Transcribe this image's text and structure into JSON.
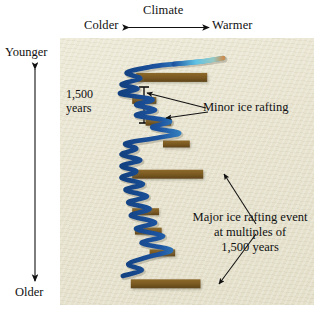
{
  "figure": {
    "background_color": "#ffffff",
    "panel_color": "#e9e5d2"
  },
  "climate_axis": {
    "title": "Climate",
    "left_label": "Colder",
    "right_label": "Warmer",
    "arrow": "double-headed-horizontal"
  },
  "time_axis": {
    "top_label": "Younger",
    "bottom_label": "Older",
    "arrow": "double-headed-vertical"
  },
  "scale_bar": {
    "line1": "1,500",
    "line2": "years",
    "glyph": "i-beam"
  },
  "annotations": {
    "minor": "Minor ice rafting",
    "major_line1": "Major ice rafting event",
    "major_line2": "at multiples of",
    "major_line3": "1,500 years"
  },
  "chart_data": {
    "type": "line",
    "title": "Climate",
    "xlabel": "Climate",
    "ylabel": "Time",
    "grid": false,
    "legend": null,
    "x_axis": {
      "direction": "left-to-right",
      "left_tick_label": "Colder",
      "right_tick_label": "Warmer"
    },
    "y_axis": {
      "direction": "top-to-bottom",
      "top_tick_label": "Younger",
      "bottom_tick_label": "Older",
      "scale_reference": "1,500 years"
    },
    "series": [
      {
        "name": "climate-proxy-curve",
        "description": "Oscillating climate proxy record, warm (right) to cold (left) excursions",
        "color_cold": "#1d54a0",
        "color_warm": "#5fc3e4",
        "color_tip": "#c98f52",
        "points": [
          [
            0.95,
            0.025
          ],
          [
            0.78,
            0.04
          ],
          [
            0.58,
            0.05
          ],
          [
            0.4,
            0.062
          ],
          [
            0.23,
            0.085
          ],
          [
            0.33,
            0.11
          ],
          [
            0.19,
            0.133
          ],
          [
            0.31,
            0.152
          ],
          [
            0.18,
            0.172
          ],
          [
            0.42,
            0.196
          ],
          [
            0.3,
            0.218
          ],
          [
            0.44,
            0.24
          ],
          [
            0.3,
            0.262
          ],
          [
            0.55,
            0.286
          ],
          [
            0.42,
            0.312
          ],
          [
            0.62,
            0.335
          ],
          [
            0.44,
            0.356
          ],
          [
            0.22,
            0.378
          ],
          [
            0.3,
            0.4
          ],
          [
            0.19,
            0.424
          ],
          [
            0.33,
            0.447
          ],
          [
            0.19,
            0.47
          ],
          [
            0.3,
            0.494
          ],
          [
            0.19,
            0.52
          ],
          [
            0.35,
            0.545
          ],
          [
            0.22,
            0.57
          ],
          [
            0.38,
            0.596
          ],
          [
            0.24,
            0.622
          ],
          [
            0.4,
            0.648
          ],
          [
            0.26,
            0.676
          ],
          [
            0.44,
            0.704
          ],
          [
            0.3,
            0.732
          ],
          [
            0.5,
            0.76
          ],
          [
            0.34,
            0.79
          ],
          [
            0.56,
            0.818
          ],
          [
            0.38,
            0.848
          ],
          [
            0.24,
            0.876
          ],
          [
            0.34,
            0.902
          ],
          [
            0.2,
            0.925
          ]
        ]
      }
    ],
    "events": [
      {
        "label": "major ice rafting event",
        "magnitude": "major",
        "x_start": 0.3,
        "width": 0.53,
        "y": 0.105
      },
      {
        "label": "minor ice rafting",
        "magnitude": "minor",
        "x_start": 0.27,
        "width": 0.18,
        "y": 0.2
      },
      {
        "label": "minor ice rafting",
        "magnitude": "minor",
        "x_start": 0.37,
        "width": 0.19,
        "y": 0.29
      },
      {
        "label": "minor ice rafting",
        "magnitude": "minor",
        "x_start": 0.5,
        "width": 0.2,
        "y": 0.38
      },
      {
        "label": "major ice rafting event",
        "magnitude": "major",
        "x_start": 0.27,
        "width": 0.53,
        "y": 0.505
      },
      {
        "label": "minor ice rafting",
        "magnitude": "minor",
        "x_start": 0.27,
        "width": 0.2,
        "y": 0.66
      },
      {
        "label": "minor ice rafting",
        "magnitude": "minor",
        "x_start": 0.29,
        "width": 0.2,
        "y": 0.74
      },
      {
        "label": "minor ice rafting",
        "magnitude": "minor",
        "x_start": 0.4,
        "width": 0.19,
        "y": 0.83
      },
      {
        "label": "major ice rafting event",
        "magnitude": "major",
        "x_start": 0.26,
        "width": 0.52,
        "y": 0.958
      }
    ],
    "event_color": "#7b5a22"
  }
}
